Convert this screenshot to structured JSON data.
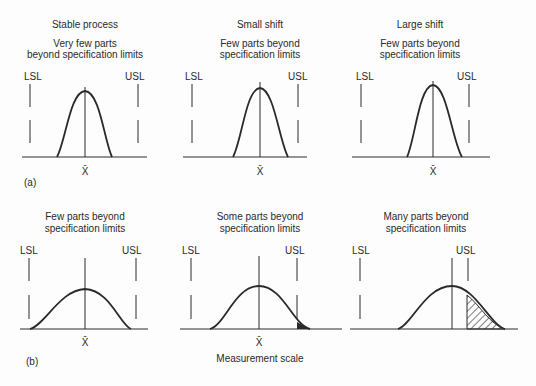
{
  "figure": {
    "row_a": {
      "tag": "(a)",
      "panels": [
        {
          "heading": "Stable process",
          "subtitle_1": "Very few parts",
          "subtitle_2": "beyond specification limits",
          "lsl": "LSL",
          "usl": "USL",
          "mean": "X̄"
        },
        {
          "heading": "Small shift",
          "subtitle_1": "Few parts beyond",
          "subtitle_2": "specification limits",
          "lsl": "LSL",
          "usl": "USL",
          "mean": "X̄"
        },
        {
          "heading": "Large shift",
          "subtitle_1": "Few parts beyond",
          "subtitle_2": "specification limits",
          "lsl": "LSL",
          "usl": "USL",
          "mean": "X̄"
        }
      ]
    },
    "row_b": {
      "tag": "(b)",
      "axis_label": "Measurement scale",
      "panels": [
        {
          "subtitle_1": "Few parts beyond",
          "subtitle_2": "specification limits",
          "lsl": "LSL",
          "usl": "USL",
          "mean": "X̄"
        },
        {
          "subtitle_1": "Some parts beyond",
          "subtitle_2": "specification limits",
          "lsl": "LSL",
          "usl": "USL",
          "mean": "X̄"
        },
        {
          "subtitle_1": "Many parts beyond",
          "subtitle_2": "specification limits",
          "lsl": "LSL",
          "usl": "USL"
        }
      ]
    },
    "colors": {
      "ink": "#2a2a2a",
      "background": "#fdfdfd"
    }
  }
}
